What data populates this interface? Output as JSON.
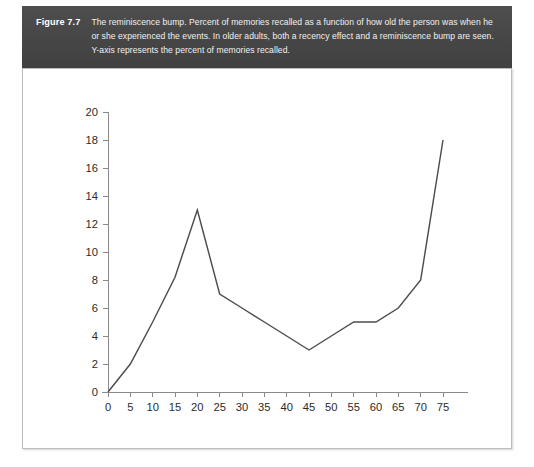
{
  "figure": {
    "label": "Figure 7.7",
    "caption": "The reminiscence bump. Percent of memories recalled as a function of how old the person was when he or she experienced the events. In older adults, both a recency effect and a reminiscence bump are seen. Y-axis represents the percent of memories recalled.",
    "band_color": "#464646",
    "plate_border_color": "#bdbdbd",
    "line_color": "#4d4d4d"
  },
  "chart_data": {
    "type": "line",
    "title": "",
    "subtitle": "",
    "xlabel": "",
    "ylabel": "",
    "xlim": [
      0,
      75
    ],
    "ylim": [
      0,
      20
    ],
    "grid": false,
    "legend": null,
    "xticks": [
      0,
      5,
      10,
      15,
      20,
      25,
      30,
      35,
      40,
      45,
      50,
      55,
      60,
      65,
      70,
      75
    ],
    "yticks": [
      0,
      2,
      4,
      6,
      8,
      10,
      12,
      14,
      16,
      18,
      20
    ],
    "x": [
      0,
      5,
      10,
      15,
      20,
      25,
      30,
      35,
      40,
      45,
      50,
      55,
      60,
      65,
      70,
      75
    ],
    "values": [
      0,
      2,
      5,
      8.2,
      13,
      7,
      6,
      5,
      4,
      3,
      4,
      5,
      5,
      6,
      8,
      18
    ],
    "series": [
      {
        "name": "Percent of memories recalled",
        "values": [
          0,
          2,
          5,
          8.2,
          13,
          7,
          6,
          5,
          4,
          3,
          4,
          5,
          5,
          6,
          8,
          18
        ]
      }
    ]
  }
}
